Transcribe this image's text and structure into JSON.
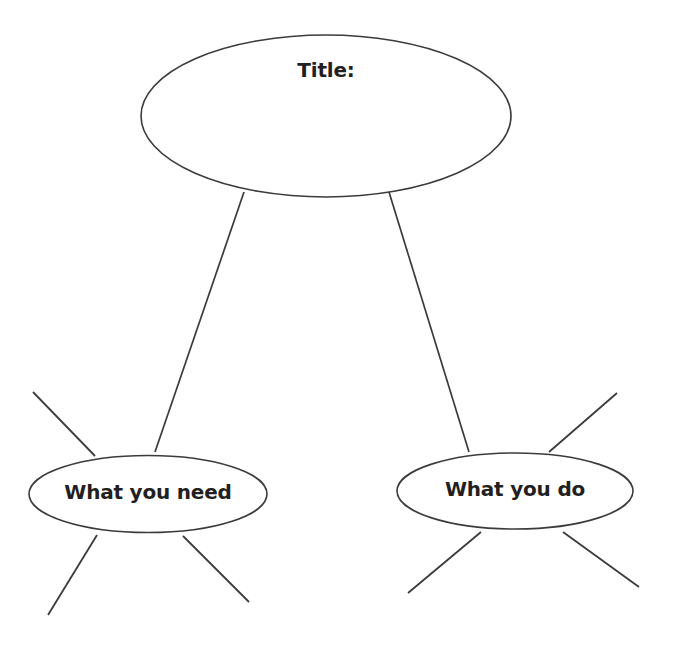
{
  "page": {
    "background_color": "#ffffff",
    "stroke_color": "#3b3b3b",
    "text_color": "#231f20",
    "width": 673,
    "height": 651
  },
  "diagram": {
    "type": "graphic-organizer",
    "nodes": [
      {
        "id": "title",
        "label": "Title:",
        "shape": "ellipse",
        "cx": 326,
        "cy": 116,
        "rx": 185,
        "ry": 81
      },
      {
        "id": "what-you-need",
        "label": "What you need",
        "shape": "ellipse",
        "cx": 148,
        "cy": 494,
        "rx": 119,
        "ry": 38.5
      },
      {
        "id": "what-you-do",
        "label": "What you do",
        "shape": "ellipse",
        "cx": 515,
        "cy": 491,
        "rx": 118,
        "ry": 38
      }
    ],
    "connectors": [
      {
        "id": "title-to-need",
        "from": "title",
        "to": "what-you-need",
        "x1": 244,
        "y1": 192,
        "x2": 155,
        "y2": 452
      },
      {
        "id": "title-to-do",
        "from": "title",
        "to": "what-you-do",
        "x1": 389,
        "y1": 192,
        "x2": 469,
        "y2": 452
      }
    ],
    "spokes": [
      {
        "id": "need-spoke-upper-left",
        "node": "what-you-need",
        "x1": 95,
        "y1": 456,
        "x2": 33,
        "y2": 392
      },
      {
        "id": "need-spoke-lower-left",
        "node": "what-you-need",
        "x1": 97,
        "y1": 535,
        "x2": 48,
        "y2": 615
      },
      {
        "id": "need-spoke-lower-right",
        "node": "what-you-need",
        "x1": 183,
        "y1": 536,
        "x2": 249,
        "y2": 602
      },
      {
        "id": "do-spoke-upper-right",
        "node": "what-you-do",
        "x1": 549,
        "y1": 452,
        "x2": 617,
        "y2": 393
      },
      {
        "id": "do-spoke-lower-left",
        "node": "what-you-do",
        "x1": 481,
        "y1": 532,
        "x2": 408,
        "y2": 593
      },
      {
        "id": "do-spoke-lower-right",
        "node": "what-you-do",
        "x1": 563,
        "y1": 532,
        "x2": 639,
        "y2": 587
      }
    ]
  }
}
